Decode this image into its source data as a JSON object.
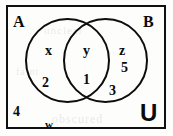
{
  "figure": {
    "universe_label": "U",
    "set_a_label": "A",
    "set_b_label": "B"
  },
  "chart_data": {
    "type": "diagram",
    "diagram_kind": "venn",
    "sets": [
      "A",
      "B"
    ],
    "universe": "U",
    "regions": [
      {
        "region": "A only",
        "elements": [
          "x",
          "2"
        ]
      },
      {
        "region": "A intersect B",
        "elements": [
          "y",
          "1"
        ]
      },
      {
        "region": "B only",
        "elements": [
          "z",
          "5",
          "3"
        ]
      },
      {
        "region": "outside A and B",
        "elements": [
          "4",
          "w"
        ]
      }
    ],
    "labels": {
      "set_a": "A",
      "set_b": "B",
      "universe": "U"
    }
  },
  "elements": {
    "a_only_letter": "x",
    "a_only_number": "2",
    "intersection_letter": "y",
    "intersection_number": "1",
    "b_only_letter": "z",
    "b_only_number_upper": "5",
    "b_only_number_lower": "3",
    "outside_number": "4",
    "outside_letter": "w"
  },
  "ghost_text": {
    "line_one": "unclear",
    "line_two": "obscured",
    "line_three": "faint"
  },
  "colors": {
    "ink": "#0a0a0a",
    "paper": "#fdfdfc",
    "ghost": "#787a7d"
  }
}
